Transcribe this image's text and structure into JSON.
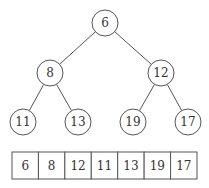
{
  "tree": {
    "nodes": [
      {
        "id": 0,
        "value": "6"
      },
      {
        "id": 1,
        "value": "8"
      },
      {
        "id": 2,
        "value": "12"
      },
      {
        "id": 3,
        "value": "11"
      },
      {
        "id": 4,
        "value": "13"
      },
      {
        "id": 5,
        "value": "19"
      },
      {
        "id": 6,
        "value": "17"
      }
    ],
    "edges": [
      [
        0,
        1
      ],
      [
        0,
        2
      ],
      [
        1,
        3
      ],
      [
        1,
        4
      ],
      [
        2,
        5
      ],
      [
        2,
        6
      ]
    ]
  },
  "array": {
    "cells": [
      "6",
      "8",
      "12",
      "11",
      "13",
      "19",
      "17"
    ]
  },
  "colors": {
    "stroke": "#555555",
    "text": "#333333",
    "background": "#ffffff"
  }
}
